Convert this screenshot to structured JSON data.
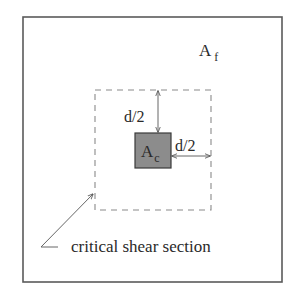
{
  "diagram": {
    "footing_area_label": "A",
    "footing_area_subscript": "f",
    "column_area_label": "A",
    "column_area_subscript": "c",
    "vertical_offset_label": "d/2",
    "horizontal_offset_label": "d/2",
    "critical_section_label": "critical shear section"
  },
  "colors": {
    "outline": "#555555",
    "dashed": "#8a8a8a",
    "column_fill": "#8c8c8c",
    "column_border": "#3a3a3a",
    "text": "#2a2a2a"
  }
}
